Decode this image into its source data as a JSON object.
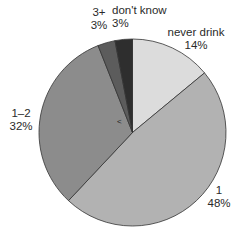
{
  "chart_data": {
    "type": "pie",
    "title": "",
    "start_angle": "12 o'clock",
    "direction": "clockwise",
    "categories": [
      "never drink",
      "1",
      "1–2",
      "3+",
      "don't know"
    ],
    "values": [
      14,
      48,
      32,
      3,
      3
    ],
    "value_labels": [
      "14%",
      "48%",
      "32%",
      "3%",
      "3%"
    ],
    "colors": [
      "#dcdcdc",
      "#b2b2b2",
      "#8c8c8c",
      "#5c5c5c",
      "#2e2e2e"
    ],
    "legend": "none (direct labels)",
    "annotation": "<"
  },
  "labels": [
    {
      "name": "never drink",
      "pct": "14%"
    },
    {
      "name": "1",
      "pct": "48%"
    },
    {
      "name": "1–2",
      "pct": "32%"
    },
    {
      "name": "3+",
      "pct": "3%"
    },
    {
      "name": "don't know",
      "pct": "3%"
    }
  ],
  "annotation_mark": "<"
}
